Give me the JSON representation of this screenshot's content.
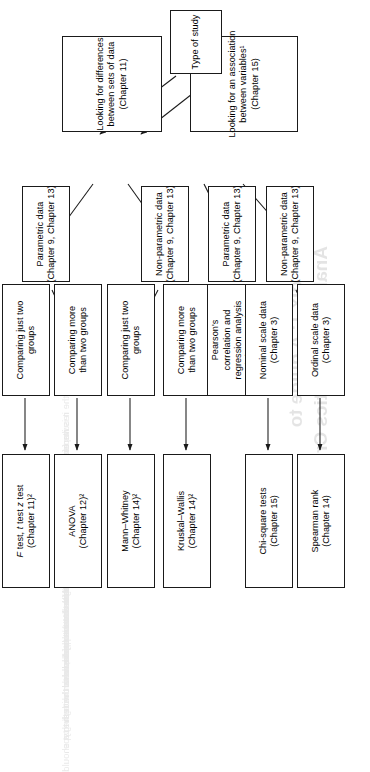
{
  "page": {
    "bleed_through": {
      "title_line1": "Appendix 1: A guide to",
      "title_line2": "Analysing Statistics Critically",
      "paragraph_lines": [
        "the results of the study and the statistical tests that were used,",
        "it is important to be able to decide whether the tests applied",
        "were appropriate for the type of data that were collected and",
        "for the questions that the researchers set out to answer.",
        "The flow chart opposite is designed to help you work through",
        "the decisions that a researcher has to make when choosing a",
        "statistical test. Begin at the bottom of the chart with the type",
        "of study and follow the arrows upwards to the test that should",
        "have been used in that situation."
      ]
    }
  },
  "chart_data": {
    "type": "diagram",
    "orientation": "rotated-90-ccw",
    "nodes": [
      {
        "id": "type-of-study",
        "level": 0,
        "lines": [
          "Type of study"
        ]
      },
      {
        "id": "differences",
        "level": 1,
        "lines": [
          "Looking for differences",
          "between sets of data",
          "(Chapter 11)"
        ]
      },
      {
        "id": "association",
        "level": 1,
        "lines": [
          "Looking for an association",
          "between variables¹",
          "(Chapter 15)"
        ]
      },
      {
        "id": "diff-parametric",
        "level": 2,
        "lines": [
          "Parametric data",
          "(Chapter 9, Chapter 13)"
        ]
      },
      {
        "id": "diff-nonparametric",
        "level": 2,
        "lines": [
          "Non-parametric data",
          "(Chapter 9, Chapter 13)"
        ]
      },
      {
        "id": "assoc-parametric",
        "level": 2,
        "lines": [
          "Parametric data",
          "(Chapter 9, Chapter 13)"
        ]
      },
      {
        "id": "assoc-nonparametric",
        "level": 2,
        "lines": [
          "Non-parametric data",
          "(Chapter 9, Chapter 13)"
        ]
      },
      {
        "id": "par-two-groups",
        "level": 3,
        "lines": [
          "Comparing just two",
          "groups"
        ]
      },
      {
        "id": "par-more-groups",
        "level": 3,
        "lines": [
          "Comparing more",
          "than two groups"
        ]
      },
      {
        "id": "nonpar-two-groups",
        "level": 3,
        "lines": [
          "Comparing just two",
          "groups"
        ]
      },
      {
        "id": "nonpar-more-groups",
        "level": 3,
        "lines": [
          "Comparing more",
          "than two groups"
        ]
      },
      {
        "id": "pearsons",
        "level": 3,
        "lines": [
          "Pearson's",
          "correlation and",
          "regression analysis",
          "(Chapter 16)"
        ]
      },
      {
        "id": "nominal-scale",
        "level": 3,
        "lines": [
          "Nominal scale data",
          "(Chapter 3)"
        ]
      },
      {
        "id": "ordinal-scale",
        "level": 3,
        "lines": [
          "Ordinal scale data",
          "(Chapter 3)"
        ]
      },
      {
        "id": "f-t-z-test",
        "level": 4,
        "lines": [
          "F test, t test z test",
          "(Chapter 11)²"
        ]
      },
      {
        "id": "anova",
        "level": 4,
        "lines": [
          "ANOVA",
          "(Chapter 12)²"
        ]
      },
      {
        "id": "mann-whitney",
        "level": 4,
        "lines": [
          "Mann–Whitney",
          "(Chapter 14)²"
        ]
      },
      {
        "id": "kruskal-wallis",
        "level": 4,
        "lines": [
          "Kruskal–Wallis",
          "(Chapter 14)²"
        ]
      },
      {
        "id": "chi-square",
        "level": 4,
        "lines": [
          "Chi-square tests",
          "(Chapter 15)"
        ]
      },
      {
        "id": "spearman",
        "level": 4,
        "lines": [
          "Spearman rank",
          "(Chapter 14)"
        ]
      }
    ],
    "edges": [
      {
        "from": "type-of-study",
        "to": "differences"
      },
      {
        "from": "type-of-study",
        "to": "association"
      },
      {
        "from": "differences",
        "to": "diff-parametric"
      },
      {
        "from": "differences",
        "to": "diff-nonparametric"
      },
      {
        "from": "association",
        "to": "assoc-parametric"
      },
      {
        "from": "association",
        "to": "assoc-nonparametric"
      },
      {
        "from": "diff-parametric",
        "to": "par-two-groups"
      },
      {
        "from": "diff-parametric",
        "to": "par-more-groups"
      },
      {
        "from": "diff-nonparametric",
        "to": "nonpar-two-groups"
      },
      {
        "from": "diff-nonparametric",
        "to": "nonpar-more-groups"
      },
      {
        "from": "assoc-parametric",
        "to": "pearsons"
      },
      {
        "from": "assoc-nonparametric",
        "to": "nominal-scale"
      },
      {
        "from": "assoc-nonparametric",
        "to": "ordinal-scale"
      },
      {
        "from": "par-two-groups",
        "to": "f-t-z-test"
      },
      {
        "from": "par-more-groups",
        "to": "anova"
      },
      {
        "from": "nonpar-two-groups",
        "to": "mann-whitney"
      },
      {
        "from": "nonpar-more-groups",
        "to": "kruskal-wallis"
      },
      {
        "from": "nominal-scale",
        "to": "chi-square"
      },
      {
        "from": "ordinal-scale",
        "to": "spearman"
      }
    ],
    "colors": {
      "box_border": "#1a1a1a",
      "box_fill": "#ffffff",
      "arrow": "#1a1a1a",
      "text": "#000000",
      "page": "#ffffff"
    }
  }
}
